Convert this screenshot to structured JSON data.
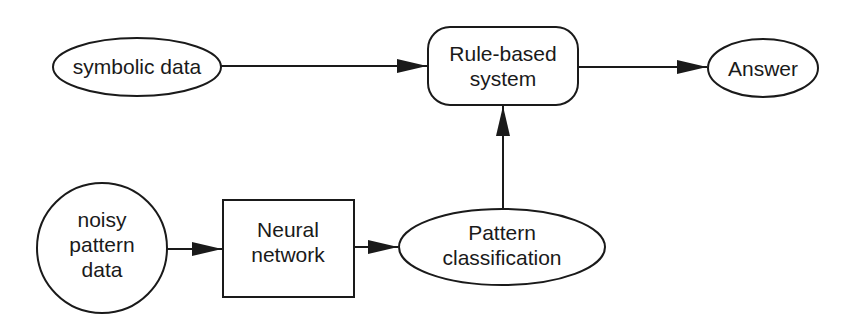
{
  "diagram": {
    "nodes": {
      "symbolic_data": {
        "label": "symbolic data",
        "shape": "ellipse"
      },
      "rule_based": {
        "lines": [
          "Rule-based",
          "system"
        ],
        "shape": "rounded-rectangle"
      },
      "answer": {
        "label": "Answer",
        "shape": "ellipse"
      },
      "noisy_data": {
        "lines": [
          "noisy",
          "pattern",
          "data"
        ],
        "shape": "circle"
      },
      "neural_network": {
        "lines": [
          "Neural",
          "network"
        ],
        "shape": "rectangle"
      },
      "pattern_classification": {
        "lines": [
          "Pattern",
          "classification"
        ],
        "shape": "ellipse"
      }
    },
    "edges": [
      {
        "from": "symbolic data",
        "to": "Rule-based system"
      },
      {
        "from": "Rule-based system",
        "to": "Answer"
      },
      {
        "from": "noisy pattern data",
        "to": "Neural network"
      },
      {
        "from": "Neural network",
        "to": "Pattern classification"
      },
      {
        "from": "Pattern classification",
        "to": "Rule-based system"
      }
    ],
    "colors": {
      "stroke": "#1a1a1a",
      "background": "#ffffff"
    }
  }
}
